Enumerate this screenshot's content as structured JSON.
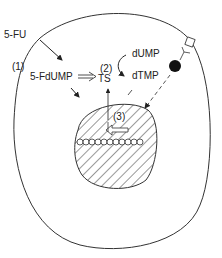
{
  "diagram": {
    "labels": {
      "fu": "5-FU",
      "step1": "(1)",
      "fdump": "5-FdUMP",
      "step2": "(2)",
      "ts": "TS",
      "dump": "dUMP",
      "dtmp": "dTMP",
      "step3": "(3)"
    },
    "elements": {
      "cell": "cell membrane",
      "nucleus": "nucleus (hatched)",
      "dna": "DNA strand",
      "transporter": "membrane transporter",
      "ligand": "square ligand"
    },
    "colors": {
      "stroke": "#333333",
      "fill": "#111111"
    }
  }
}
